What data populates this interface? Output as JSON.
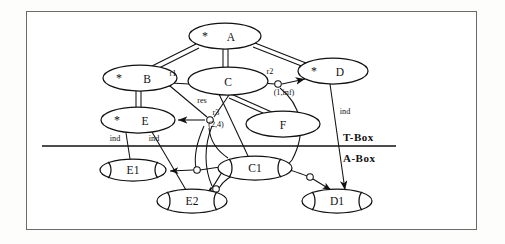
{
  "diagram": {
    "partition": {
      "tbox_label": "T-Box",
      "abox_label": "A-Box"
    },
    "concepts": [
      {
        "id": "A",
        "label": "A",
        "marker": "*",
        "cx": 225,
        "cy": 36,
        "rx": 36,
        "ry": 13
      },
      {
        "id": "B",
        "label": "B",
        "marker": "*",
        "cx": 140,
        "cy": 78,
        "rx": 37,
        "ry": 13
      },
      {
        "id": "C",
        "label": "C",
        "marker": "",
        "cx": 228,
        "cy": 81,
        "rx": 40,
        "ry": 14
      },
      {
        "id": "D",
        "label": "D",
        "marker": "*",
        "cx": 333,
        "cy": 71,
        "rx": 35,
        "ry": 13
      },
      {
        "id": "E",
        "label": "E",
        "marker": "*",
        "cx": 138,
        "cy": 120,
        "rx": 37,
        "ry": 13
      },
      {
        "id": "F",
        "label": "F",
        "marker": "",
        "cx": 283,
        "cy": 124,
        "rx": 37,
        "ry": 13
      }
    ],
    "individuals": [
      {
        "id": "E1",
        "label": "E1",
        "cx": 133,
        "cy": 170,
        "rx": 33,
        "ry": 11
      },
      {
        "id": "C1",
        "label": "C1",
        "cx": 255,
        "cy": 168,
        "rx": 37,
        "ry": 12
      },
      {
        "id": "E2",
        "label": "E2",
        "cx": 192,
        "cy": 201,
        "rx": 35,
        "ry": 12
      },
      {
        "id": "D1",
        "label": "D1",
        "cx": 337,
        "cy": 201,
        "rx": 35,
        "ry": 12
      }
    ],
    "roles": [
      {
        "id": "r1",
        "label": "r1",
        "cardinality": "",
        "x": 178,
        "y": 76
      },
      {
        "id": "r2",
        "label": "r2",
        "cardinality": "(1,inf)",
        "x": 270,
        "y": 73
      },
      {
        "id": "r3",
        "label": "r3",
        "cardinality": "(2,4)",
        "x": 214,
        "y": 113
      },
      {
        "id": "res",
        "label": "res",
        "cardinality": "",
        "x": 196,
        "y": 99
      }
    ],
    "instance_edges": [
      {
        "label": "ind",
        "from": "E",
        "to": "E1"
      },
      {
        "label": "ind",
        "from": "E",
        "to": "E2"
      },
      {
        "label": "ind",
        "from": "D",
        "to": "D1"
      }
    ],
    "edge_labels": {
      "r1": "r1",
      "r2": "r2",
      "r3": "r3",
      "res": "res",
      "card_r2": "(1,inf)",
      "card_r3": "(2,4)",
      "ind_e1": "ind",
      "ind_e2": "ind",
      "ind_d1": "ind"
    },
    "colors": {
      "stroke": "#111111",
      "frame": "#6b6b6b",
      "background": "#ffffff"
    }
  }
}
